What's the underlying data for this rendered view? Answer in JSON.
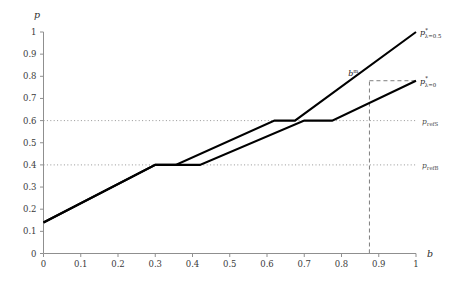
{
  "chart_data": {
    "type": "line",
    "title": "",
    "xlabel": "b",
    "ylabel": "p",
    "xlim": [
      0,
      1
    ],
    "ylim": [
      0,
      1
    ],
    "grid": false,
    "xticks": [
      "0",
      "0.1",
      "0.2",
      "0.3",
      "0.4",
      "0.5",
      "0.6",
      "0.7",
      "0.8",
      "0.9",
      "1"
    ],
    "xtick_values": [
      0,
      0.1,
      0.2,
      0.3,
      0.4,
      0.5,
      0.6,
      0.7,
      0.8,
      0.9,
      1
    ],
    "yticks": [
      "0",
      "0.1",
      "0.2",
      "0.3",
      "0.4",
      "0.5",
      "0.6",
      "0.7",
      "0.8",
      "0.9",
      "1"
    ],
    "ytick_values": [
      0,
      0.1,
      0.2,
      0.3,
      0.4,
      0.5,
      0.6,
      0.7,
      0.8,
      0.9,
      1
    ],
    "legend_position": "right-of-curve-ends",
    "series": [
      {
        "name": "p*_{lambda=0.5}",
        "label_main": "p",
        "label_sup": "*",
        "label_sub": "λ=0.5",
        "color": "#000000",
        "x": [
          0,
          0.3,
          0.355,
          0.62,
          0.675,
          1
        ],
        "y": [
          0.14,
          0.4,
          0.4,
          0.6,
          0.6,
          1.0
        ]
      },
      {
        "name": "p*_{lambda=0}",
        "label_main": "p",
        "label_sup": "*",
        "label_sub": "λ=0",
        "color": "#000000",
        "x": [
          0,
          0.3,
          0.42,
          0.7,
          0.775,
          1
        ],
        "y": [
          0.14,
          0.4,
          0.4,
          0.6,
          0.6,
          0.78
        ]
      }
    ],
    "reference_lines": [
      {
        "name": "p_refS",
        "label_main": "p",
        "label_sub": "refS",
        "axis": "y",
        "value": 0.6,
        "style": "dotted",
        "color": "#8a8a8a"
      },
      {
        "name": "p_refB",
        "label_main": "p",
        "label_sub": "refB",
        "axis": "y",
        "value": 0.4,
        "style": "dotted",
        "color": "#8a8a8a"
      }
    ],
    "annotations": [
      {
        "name": "b-star-marker",
        "label_main": "b",
        "label_sup": "m",
        "x": 0.875,
        "y": 0.78,
        "vertical_line": {
          "style": "dashed",
          "from_y": 0,
          "to_y": 0.78,
          "color": "#6e6e6e"
        },
        "horizontal_line": {
          "style": "dashed",
          "from_x": 0.875,
          "to_x": 1,
          "y": 0.78,
          "color": "#6e6e6e"
        },
        "x_tick_value": 0.875
      }
    ]
  },
  "axes": {
    "y_axis_name": "p",
    "x_axis_name": "b"
  }
}
